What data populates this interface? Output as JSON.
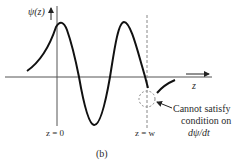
{
  "figure": {
    "y_axis_label": "ψ(z)",
    "x_axis_label": "z",
    "marker_left_label": "z = 0",
    "marker_right_label": "z = w",
    "annotation_lines": [
      "Cannot satisfy",
      "condition on",
      "dψ/dt"
    ],
    "caption": "(b)"
  },
  "colors": {
    "ink": "#111111",
    "axis": "#555555",
    "dashed": "#888888",
    "text": "#2b2b2b"
  }
}
